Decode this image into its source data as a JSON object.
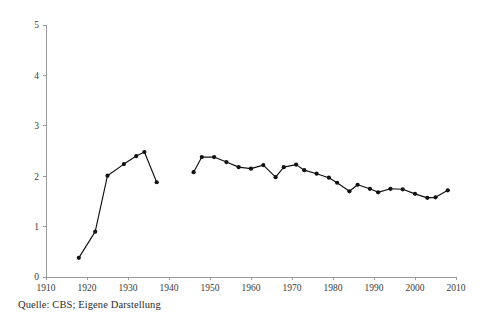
{
  "caption": "Quelle: CBS; Eigene Darstellung",
  "chart_data": {
    "type": "line",
    "title": "",
    "xlabel": "",
    "ylabel": "",
    "xlim": [
      1910,
      2010
    ],
    "ylim": [
      0,
      5
    ],
    "grid": false,
    "legend": null,
    "x_ticks": [
      1910,
      1920,
      1930,
      1940,
      1950,
      1960,
      1970,
      1980,
      1990,
      2000,
      2010
    ],
    "y_ticks": [
      0,
      1,
      2,
      3,
      4,
      5
    ],
    "x_tick_labels": [
      "1910",
      "1920",
      "1930",
      "1940",
      "1950",
      "1960",
      "1970",
      "1980",
      "1990",
      "2000",
      "2010"
    ],
    "y_tick_labels": [
      "0",
      "1",
      "2",
      "3",
      "4",
      "5"
    ],
    "marker": "circle",
    "line_color": "#111111",
    "marker_color": "#111111",
    "axis_color": "#9a9a9a",
    "series": [
      {
        "name": "segment-1",
        "x": [
          1918,
          1922,
          1925,
          1929,
          1932,
          1934,
          1937
        ],
        "y": [
          0.38,
          0.9,
          2.01,
          2.24,
          2.4,
          2.48,
          1.88
        ]
      },
      {
        "name": "segment-2",
        "x": [
          1946,
          1948,
          1951,
          1954,
          1957,
          1960,
          1963,
          1966,
          1968,
          1971,
          1973,
          1976,
          1979,
          1981,
          1984,
          1986,
          1989,
          1991,
          1994,
          1997,
          2000,
          2003,
          2005,
          2008
        ],
        "y": [
          2.08,
          2.38,
          2.38,
          2.28,
          2.18,
          2.15,
          2.22,
          1.98,
          2.18,
          2.23,
          2.12,
          2.05,
          1.97,
          1.87,
          1.7,
          1.83,
          1.75,
          1.68,
          1.75,
          1.74,
          1.65,
          1.57,
          1.58,
          1.72
        ]
      }
    ]
  }
}
